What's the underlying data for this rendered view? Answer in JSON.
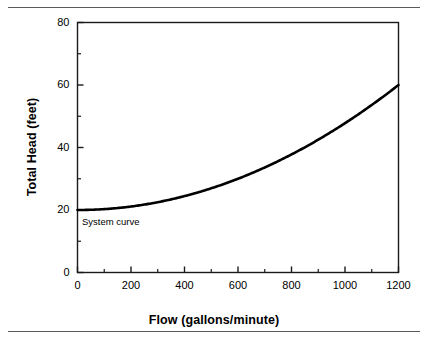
{
  "figure": {
    "top_rule": true,
    "bottom_rule": true,
    "cropped_text_above": "",
    "cropped_text_below": ""
  },
  "chart_data": {
    "type": "line",
    "title": "",
    "xlabel": "Flow (gallons/minute)",
    "ylabel": "Total Head (feet)",
    "xlim": [
      0,
      1200
    ],
    "ylim": [
      0,
      80
    ],
    "grid": false,
    "legend": "none",
    "x_major_ticks": [
      0,
      200,
      400,
      600,
      800,
      1000,
      1200
    ],
    "x_minor_ticks": [
      100,
      300,
      500,
      700,
      900,
      1100
    ],
    "y_major_ticks": [
      0,
      20,
      40,
      60,
      80
    ],
    "y_minor_ticks": [
      10,
      30,
      50,
      70
    ],
    "x_tick_labels": [
      "0",
      "200",
      "400",
      "600",
      "800",
      "1000",
      "1200"
    ],
    "y_tick_labels": [
      "0",
      "20",
      "40",
      "60",
      "80"
    ],
    "annotations": [
      {
        "text": "System curve",
        "x": 60,
        "y": 14.5
      }
    ],
    "series": [
      {
        "name": "System curve",
        "color": "#000000",
        "line_width": 2.6,
        "equation": "H = 20 + 40*(Q/1200)^2",
        "x": [
          0,
          100,
          200,
          300,
          400,
          500,
          600,
          700,
          800,
          900,
          1000,
          1100,
          1200
        ],
        "values": [
          20.0,
          20.3,
          21.1,
          22.5,
          24.4,
          26.9,
          30.0,
          33.6,
          37.8,
          42.5,
          47.8,
          53.6,
          60.0
        ]
      }
    ]
  }
}
